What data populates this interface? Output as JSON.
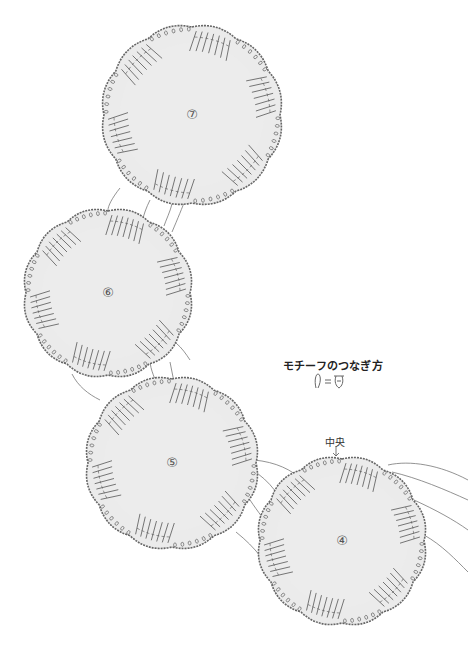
{
  "diagram": {
    "title": "モチーフのつなぎ方",
    "legend_symbol": "ℓ=ℛ",
    "legend_symbol_meaning": "join-picot-equals-joined-picot",
    "center_label": "中央",
    "colors": {
      "fill": "#ebebeb",
      "outline": "#666666",
      "stitch": "#555555",
      "background": "#ffffff"
    },
    "motifs": [
      {
        "id": "7",
        "label": "⑦",
        "cx": 192,
        "cy": 115,
        "r": 88
      },
      {
        "id": "6",
        "label": "⑥",
        "cx": 108,
        "cy": 293,
        "r": 82
      },
      {
        "id": "5",
        "label": "⑤",
        "cx": 172,
        "cy": 463,
        "r": 84
      },
      {
        "id": "4",
        "label": "④",
        "cx": 342,
        "cy": 541,
        "r": 82
      }
    ]
  }
}
